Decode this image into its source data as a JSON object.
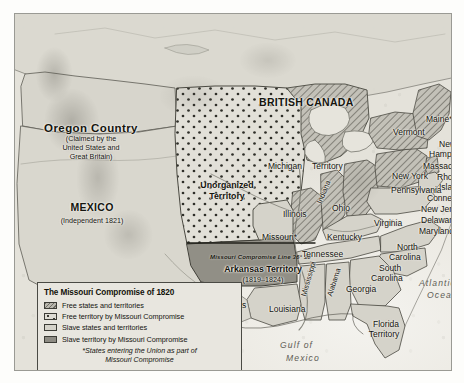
{
  "map": {
    "title": "The Missouri Compromise of 1820",
    "countries": [
      {
        "name": "british-canada",
        "label": "BRITISH CANADA"
      },
      {
        "name": "mexico",
        "label": "MEXICO"
      },
      {
        "name": "mexico-sub",
        "label": "(Independent 1821)"
      }
    ],
    "oregon": {
      "label": "Oregon Country",
      "sub_line1": "(Claimed by the",
      "sub_line2": "United States and",
      "sub_line3": "Great Britain)"
    },
    "territories": [
      {
        "name": "unorganized-territory",
        "line1": "Unorganized",
        "line2": "Territory"
      },
      {
        "name": "arkansas-territory",
        "line1": "Arkansas Territory",
        "line2": "(1819–1824)"
      },
      {
        "name": "michigan-territory",
        "line1": "Michigan",
        "line2": "Territory"
      },
      {
        "name": "florida-territory",
        "line1": "Florida",
        "line2": "Territory"
      }
    ],
    "compromise_line_label": "Missouri Compromise Line 36° 30'",
    "states": [
      {
        "name": "maine",
        "label": "Maine*"
      },
      {
        "name": "vermont",
        "label": "Vermont"
      },
      {
        "name": "new-hampshire-1",
        "label": "New"
      },
      {
        "name": "new-hampshire-2",
        "label": "Hampshire"
      },
      {
        "name": "massachusetts",
        "label": "Massachusetts"
      },
      {
        "name": "rhode-island-1",
        "label": "Rhode"
      },
      {
        "name": "rhode-island-2",
        "label": "Island"
      },
      {
        "name": "connecticut",
        "label": "Connecticut"
      },
      {
        "name": "new-york",
        "label": "New York"
      },
      {
        "name": "new-jersey",
        "label": "New Jersey"
      },
      {
        "name": "pennsylvania",
        "label": "Pennsylvania"
      },
      {
        "name": "delaware",
        "label": "Delaware"
      },
      {
        "name": "maryland",
        "label": "Maryland"
      },
      {
        "name": "virginia",
        "label": "Virginia"
      },
      {
        "name": "north-carolina-1",
        "label": "North"
      },
      {
        "name": "north-carolina-2",
        "label": "Carolina"
      },
      {
        "name": "south-carolina-1",
        "label": "South"
      },
      {
        "name": "south-carolina-2",
        "label": "Carolina"
      },
      {
        "name": "georgia",
        "label": "Georgia"
      },
      {
        "name": "ohio",
        "label": "Ohio"
      },
      {
        "name": "indiana",
        "label": "Indiana"
      },
      {
        "name": "illinois",
        "label": "Illinois"
      },
      {
        "name": "kentucky",
        "label": "Kentucky"
      },
      {
        "name": "tennessee",
        "label": "Tennessee"
      },
      {
        "name": "missouri",
        "label": "Missouri*"
      },
      {
        "name": "mississippi",
        "label": "Mississippi"
      },
      {
        "name": "alabama",
        "label": "Alabama"
      },
      {
        "name": "louisiana",
        "label": "Louisiana"
      },
      {
        "name": "texas",
        "label": "Texas"
      }
    ],
    "waters": [
      {
        "name": "atlantic-ocean-1",
        "label": "Atlantic"
      },
      {
        "name": "atlantic-ocean-2",
        "label": "Ocean"
      },
      {
        "name": "gulf-of-mexico-1",
        "label": "Gulf  of"
      },
      {
        "name": "gulf-of-mexico-2",
        "label": "Mexico"
      }
    ]
  },
  "legend": {
    "title": "The Missouri Compromise of 1820",
    "items": [
      {
        "swatch": "free-states-swatch",
        "label": "Free states and territories"
      },
      {
        "swatch": "free-territory-mc-swatch",
        "label": "Free territory by Missouri Compromise"
      },
      {
        "swatch": "slave-states-swatch",
        "label": "Slave states and territories"
      },
      {
        "swatch": "slave-territory-mc-swatch",
        "label": "Slave territory by Missouri Compromise"
      }
    ],
    "note_line1": "*States entering the Union as part of",
    "note_line2": "Missouri Compromise"
  },
  "colors": {
    "free": "#b9b7ae",
    "free_mc": "#dedcd4",
    "slave": "#d5d3ca",
    "slave_mc": "#8e8c84",
    "frame": "#9a9a94",
    "ink": "#15150f"
  }
}
